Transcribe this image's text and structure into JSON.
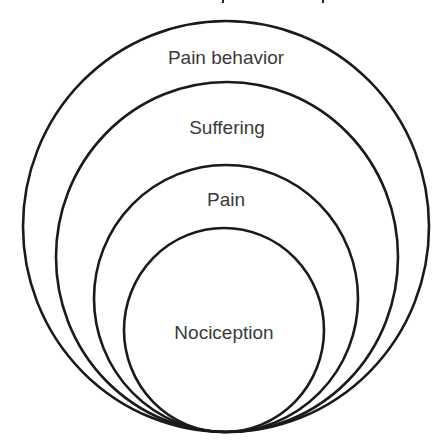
{
  "diagram": {
    "type": "nested-circles",
    "colors": {
      "stroke": "#1a1a1a",
      "text": "#3a3a3a",
      "background": "#ffffff"
    },
    "layers": [
      {
        "label": "Pain behavior",
        "cx": 226,
        "cy": 226.5,
        "rx": 203,
        "ry": 205.5,
        "label_y": 64
      },
      {
        "label": "Suffering",
        "cx": 227,
        "cy": 257,
        "rx": 171,
        "ry": 175,
        "label_y": 134
      },
      {
        "label": "Pain",
        "cx": 226,
        "cy": 298.5,
        "rx": 132,
        "ry": 133.5,
        "label_y": 206
      },
      {
        "label": "Nociception",
        "cx": 224,
        "cy": 330,
        "rx": 100,
        "ry": 102,
        "label_y": 339
      }
    ]
  }
}
